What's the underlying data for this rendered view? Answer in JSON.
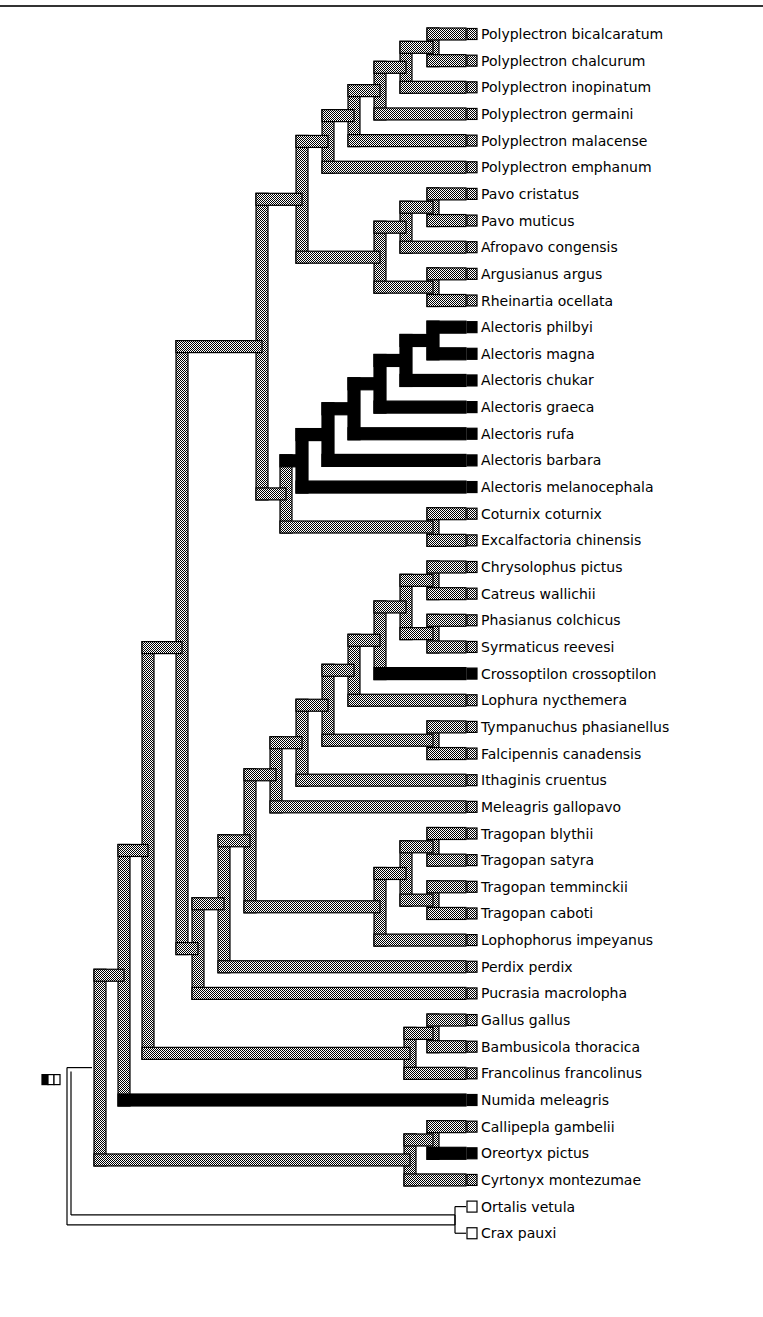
{
  "figure": {
    "type": "cladogram",
    "states": {
      "gray": {
        "fill": "checker",
        "color_a": "#000000",
        "color_b": "#ffffff"
      },
      "black": {
        "fill": "#000000"
      },
      "white": {
        "fill": "#ffffff"
      }
    },
    "root_marker": "character-state-legend-box",
    "tree": {
      "state": "white",
      "children": [
        {
          "state": "gray",
          "children": [
            {
              "state": "gray",
              "children": [
                {
                  "state": "gray",
                  "children": [
                    {
                      "state": "gray",
                      "children": [
                        {
                          "state": "gray",
                          "children": [
                            {
                              "state": "gray",
                              "children": [
                                {
                                  "state": "gray",
                                  "children": [
                                    {
                                      "state": "gray",
                                      "children": [
                                        {
                                          "state": "gray",
                                          "children": [
                                            {
                                              "state": "gray",
                                              "children": [
                                                {
                                                  "name": "Polyplectron bicalcaratum",
                                                  "state": "gray"
                                                },
                                                {
                                                  "name": "Polyplectron chalcurum",
                                                  "state": "gray"
                                                }
                                              ]
                                            },
                                            {
                                              "name": "Polyplectron inopinatum",
                                              "state": "gray"
                                            }
                                          ]
                                        },
                                        {
                                          "name": "Polyplectron germaini",
                                          "state": "gray"
                                        }
                                      ]
                                    },
                                    {
                                      "name": "Polyplectron malacense",
                                      "state": "gray"
                                    }
                                  ]
                                },
                                {
                                  "name": "Polyplectron emphanum",
                                  "state": "gray"
                                }
                              ]
                            },
                            {
                              "state": "gray",
                              "children": [
                                {
                                  "state": "gray",
                                  "children": [
                                    {
                                      "state": "gray",
                                      "children": [
                                        {
                                          "name": "Pavo cristatus",
                                          "state": "gray"
                                        },
                                        {
                                          "name": "Pavo muticus",
                                          "state": "gray"
                                        }
                                      ]
                                    },
                                    {
                                      "name": "Afropavo congensis",
                                      "state": "gray"
                                    }
                                  ]
                                },
                                {
                                  "state": "gray",
                                  "children": [
                                    {
                                      "name": "Argusianus argus",
                                      "state": "gray"
                                    },
                                    {
                                      "name": "Rheinartia ocellata",
                                      "state": "gray"
                                    }
                                  ]
                                }
                              ]
                            }
                          ]
                        },
                        {
                          "state": "gray",
                          "children": [
                            {
                              "state": "black",
                              "children": [
                                {
                                  "state": "black",
                                  "children": [
                                    {
                                      "state": "black",
                                      "children": [
                                        {
                                          "state": "black",
                                          "children": [
                                            {
                                              "state": "black",
                                              "children": [
                                                {
                                                  "state": "black",
                                                  "children": [
                                                    {
                                                      "name": "Alectoris philbyi",
                                                      "state": "black"
                                                    },
                                                    {
                                                      "name": "Alectoris magna",
                                                      "state": "black"
                                                    }
                                                  ]
                                                },
                                                {
                                                  "name": "Alectoris chukar",
                                                  "state": "black"
                                                }
                                              ]
                                            },
                                            {
                                              "name": "Alectoris graeca",
                                              "state": "black"
                                            }
                                          ]
                                        },
                                        {
                                          "name": "Alectoris rufa",
                                          "state": "black"
                                        }
                                      ]
                                    },
                                    {
                                      "name": "Alectoris barbara",
                                      "state": "black"
                                    }
                                  ]
                                },
                                {
                                  "name": "Alectoris melanocephala",
                                  "state": "black"
                                }
                              ]
                            },
                            {
                              "state": "gray",
                              "children": [
                                {
                                  "name": "Coturnix coturnix",
                                  "state": "gray"
                                },
                                {
                                  "name": "Excalfactoria chinensis",
                                  "state": "gray"
                                }
                              ]
                            }
                          ]
                        }
                      ]
                    },
                    {
                      "state": "gray",
                      "children": [
                        {
                          "state": "gray",
                          "children": [
                            {
                              "state": "gray",
                              "children": [
                                {
                                  "state": "gray",
                                  "children": [
                                    {
                                      "state": "gray",
                                      "children": [
                                        {
                                          "state": "gray",
                                          "children": [
                                            {
                                              "state": "gray",
                                              "children": [
                                                {
                                                  "state": "gray",
                                                  "children": [
                                                    {
                                                      "name": "Chrysolophus pictus",
                                                      "state": "gray"
                                                    },
                                                    {
                                                      "name": "Catreus wallichii",
                                                      "state": "gray"
                                                    }
                                                  ]
                                                },
                                                {
                                                  "state": "gray",
                                                  "children": [
                                                    {
                                                      "name": "Phasianus colchicus",
                                                      "state": "gray"
                                                    },
                                                    {
                                                      "name": "Syrmaticus reevesi",
                                                      "state": "gray"
                                                    }
                                                  ]
                                                }
                                              ]
                                            },
                                            {
                                              "name": "Crossoptilon crossoptilon",
                                              "state": "black"
                                            }
                                          ]
                                        },
                                        {
                                          "name": "Lophura nycthemera",
                                          "state": "gray"
                                        }
                                      ]
                                    },
                                    {
                                      "state": "gray",
                                      "children": [
                                        {
                                          "name": "Tympanuchus phasianellus",
                                          "state": "gray"
                                        },
                                        {
                                          "name": "Falcipennis canadensis",
                                          "state": "gray"
                                        }
                                      ]
                                    }
                                  ]
                                },
                                {
                                  "name": "Ithaginis cruentus",
                                  "state": "gray"
                                }
                              ]
                            },
                            {
                              "name": "Meleagris gallopavo",
                              "state": "gray"
                            }
                          ]
                        },
                        {
                          "state": "gray",
                          "children": [
                            {
                              "state": "gray",
                              "children": [
                                {
                                  "state": "gray",
                                  "children": [
                                    {
                                      "name": "Tragopan blythii",
                                      "state": "gray"
                                    },
                                    {
                                      "name": "Tragopan satyra",
                                      "state": "gray"
                                    }
                                  ]
                                },
                                {
                                  "state": "gray",
                                  "children": [
                                    {
                                      "name": "Tragopan temminckii",
                                      "state": "gray"
                                    },
                                    {
                                      "name": "Tragopan caboti",
                                      "state": "gray"
                                    }
                                  ]
                                }
                              ]
                            },
                            {
                              "name": "Lophophorus impeyanus",
                              "state": "gray"
                            }
                          ]
                        }
                      ]
                    }
                  ]
                },
                {
                  "name": "Perdix perdix",
                  "state": "gray"
                }
              ]
            },
            {
              "name": "Pucrasia macrolopha",
              "state": "gray"
            }
          ]
        },
        {
          "state": "white",
          "children": []
        }
      ]
    },
    "taxa": [
      {
        "name": "Polyplectron bicalcaratum",
        "state": "gray"
      },
      {
        "name": "Polyplectron chalcurum",
        "state": "gray"
      },
      {
        "name": "Polyplectron inopinatum",
        "state": "gray"
      },
      {
        "name": "Polyplectron germaini",
        "state": "gray"
      },
      {
        "name": "Polyplectron malacense",
        "state": "gray"
      },
      {
        "name": "Polyplectron emphanum",
        "state": "gray"
      },
      {
        "name": "Pavo cristatus",
        "state": "gray"
      },
      {
        "name": "Pavo muticus",
        "state": "gray"
      },
      {
        "name": "Afropavo congensis",
        "state": "gray"
      },
      {
        "name": "Argusianus argus",
        "state": "gray"
      },
      {
        "name": "Rheinartia ocellata",
        "state": "gray"
      },
      {
        "name": "Alectoris philbyi",
        "state": "black"
      },
      {
        "name": "Alectoris magna",
        "state": "black"
      },
      {
        "name": "Alectoris chukar",
        "state": "black"
      },
      {
        "name": "Alectoris graeca",
        "state": "black"
      },
      {
        "name": "Alectoris rufa",
        "state": "black"
      },
      {
        "name": "Alectoris barbara",
        "state": "black"
      },
      {
        "name": "Alectoris melanocephala",
        "state": "black"
      },
      {
        "name": "Coturnix coturnix",
        "state": "gray"
      },
      {
        "name": "Excalfactoria chinensis",
        "state": "gray"
      },
      {
        "name": "Chrysolophus pictus",
        "state": "gray"
      },
      {
        "name": "Catreus wallichii",
        "state": "gray"
      },
      {
        "name": "Phasianus colchicus",
        "state": "gray"
      },
      {
        "name": "Syrmaticus reevesi",
        "state": "gray"
      },
      {
        "name": "Crossoptilon crossoptilon",
        "state": "black"
      },
      {
        "name": "Lophura nycthemera",
        "state": "gray"
      },
      {
        "name": "Tympanuchus phasianellus",
        "state": "gray"
      },
      {
        "name": "Falcipennis canadensis",
        "state": "gray"
      },
      {
        "name": "Ithaginis cruentus",
        "state": "gray"
      },
      {
        "name": "Meleagris gallopavo",
        "state": "gray"
      },
      {
        "name": "Tragopan blythii",
        "state": "gray"
      },
      {
        "name": "Tragopan satyra",
        "state": "gray"
      },
      {
        "name": "Tragopan temminckii",
        "state": "gray"
      },
      {
        "name": "Tragopan caboti",
        "state": "gray"
      },
      {
        "name": "Lophophorus impeyanus",
        "state": "gray"
      },
      {
        "name": "Perdix perdix",
        "state": "gray"
      },
      {
        "name": "Pucrasia macrolopha",
        "state": "gray"
      },
      {
        "name": "Gallus gallus",
        "state": "gray"
      },
      {
        "name": "Bambusicola thoracica",
        "state": "gray"
      },
      {
        "name": "Francolinus francolinus",
        "state": "gray"
      },
      {
        "name": "Numida meleagris",
        "state": "black"
      },
      {
        "name": "Callipepla gambelii",
        "state": "gray"
      },
      {
        "name": "Oreortyx pictus",
        "state": "black"
      },
      {
        "name": "Cyrtonyx montezumae",
        "state": "gray"
      },
      {
        "name": "Ortalis vetula",
        "state": "white"
      },
      {
        "name": "Crax pauxi",
        "state": "white"
      }
    ]
  }
}
